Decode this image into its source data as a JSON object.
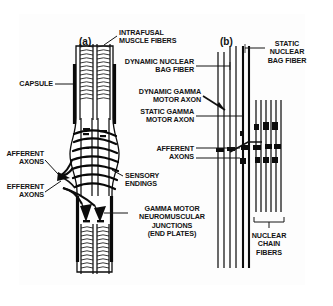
{
  "figure": {
    "border_color": "#3a3a3a",
    "background_color": "#fdfdfd",
    "ink_color": "#131313"
  },
  "panels": [
    {
      "tag": "(a)",
      "name": "panel-a-muscle-spindle"
    },
    {
      "tag": "(b)",
      "name": "panel-b-fiber-types"
    }
  ],
  "labels": {
    "intrafusal_muscle_fibers": "INTRAFUSAL\nMUSCLE FIBERS",
    "capsule": "CAPSULE",
    "afferent_axons_left": "AFFERENT\nAXONS",
    "efferent_axons": "EFFERENT\nAXONS",
    "dynamic_nuclear_bag_fiber": "DYNAMIC NUCLEAR\nBAG FIBER",
    "dynamic_gamma_motor_axon": "DYNAMIC GAMMA\nMOTOR AXON",
    "static_gamma_motor_axon": "STATIC GAMMA\nMOTOR AXON",
    "afferent_axons_right": "AFFERENT\nAXONS",
    "sensory_endings": "SENSORY\nENDINGS",
    "gamma_motor_junctions": "GAMMA MOTOR\nNEUROMUSCULAR\nJUNCTIONS\n(END PLATES)",
    "static_nuclear_bag_fiber": "STATIC\nNUCLEAR\nBAG FIBER",
    "nuclear_chain_fibers": "NUCLEAR\nCHAIN\nFIBERS"
  }
}
